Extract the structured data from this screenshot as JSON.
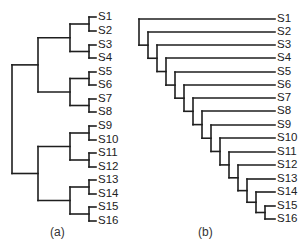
{
  "figure": {
    "panels": [
      {
        "id": "a",
        "caption": "(a)",
        "type": "balanced-dendrogram",
        "leaves": [
          "S1",
          "S2",
          "S3",
          "S4",
          "S5",
          "S6",
          "S7",
          "S8",
          "S9",
          "S10",
          "S11",
          "S12",
          "S13",
          "S14",
          "S15",
          "S16"
        ],
        "leaf_y": [
          17,
          31,
          45,
          58,
          72,
          85,
          99,
          112,
          126,
          140,
          153,
          167,
          180,
          194,
          207,
          221
        ],
        "label_x": 98,
        "leaf_bracket_x": 89,
        "level_x": [
          12,
          38,
          70,
          89
        ],
        "caption_pos": {
          "x": 50,
          "y": 233
        }
      },
      {
        "id": "b",
        "caption": "(b)",
        "type": "caterpillar-dendrogram",
        "leaves": [
          "S1",
          "S2",
          "S3",
          "S4",
          "S5",
          "S6",
          "S7",
          "S8",
          "S9",
          "S10",
          "S11",
          "S12",
          "S13",
          "S14",
          "S15",
          "S16"
        ],
        "leaf_y": [
          19,
          32,
          45,
          58,
          72,
          85,
          98,
          111,
          125,
          138,
          152,
          165,
          179,
          192,
          206,
          219
        ],
        "label_x": 277,
        "leaf_end_x": 275,
        "node_x_start": 139,
        "node_x_step": 9,
        "caption_pos": {
          "x": 198,
          "y": 233
        }
      }
    ],
    "colors": {
      "line": "#1e1e1e",
      "text": "#222222"
    }
  }
}
